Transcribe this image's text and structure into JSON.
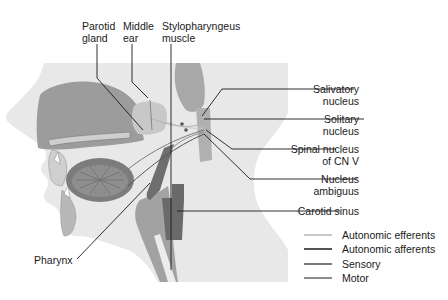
{
  "diagram": {
    "top_labels": [
      {
        "id": "parotid",
        "line1": "Parotid",
        "line2": "gland"
      },
      {
        "id": "middle-ear",
        "line1": "Middle",
        "line2": "ear"
      },
      {
        "id": "stylopharyngeus",
        "line1": "Stylopharyngeus",
        "line2": "muscle"
      }
    ],
    "right_labels": [
      {
        "id": "salivatory",
        "line1": "Salivatory",
        "line2": "nucleus"
      },
      {
        "id": "solitary",
        "line1": "Solitary",
        "line2": "nucleus"
      },
      {
        "id": "spinal-cnv",
        "line1": "Spinal nucleus",
        "line2": "of CN V"
      },
      {
        "id": "ambiguus",
        "line1": "Nucleus",
        "line2": "ambiguus"
      },
      {
        "id": "carotid",
        "line1": "Carotid sinus",
        "line2": ""
      }
    ],
    "left_labels": [
      {
        "id": "pharynx",
        "line1": "Pharynx"
      }
    ],
    "legend": [
      {
        "label": "Autonomic efferents",
        "color": "#c8c8c8"
      },
      {
        "label": "Autonomic afferents",
        "color": "#555555"
      },
      {
        "label": "Sensory",
        "color": "#7a7a7a"
      },
      {
        "label": "Motor",
        "color": "#8c8c8c"
      }
    ]
  },
  "colors": {
    "skin": "#e6e6e6",
    "dark_tissue": "#9a9a9a",
    "mid_tissue": "#b4b4b4",
    "light_tissue": "#cfcfcf",
    "carotid": "#6e6e6e",
    "leader": "#1a1a1a"
  }
}
